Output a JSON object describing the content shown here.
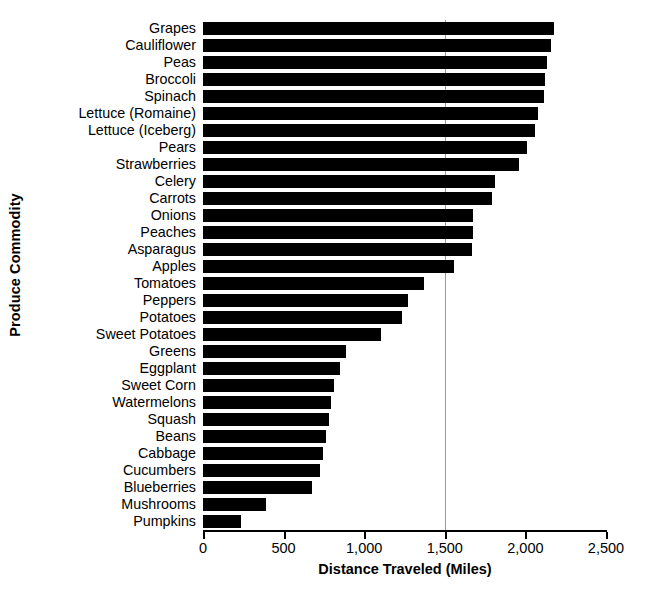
{
  "chart_data": {
    "type": "bar",
    "orientation": "horizontal",
    "title": "",
    "xlabel": "Distance Traveled (Miles)",
    "ylabel": "Produce Commodity",
    "xlim": [
      0,
      2500
    ],
    "xticks": [
      0,
      500,
      1000,
      1500,
      2000,
      2500
    ],
    "xticklabels": [
      "0",
      "500",
      "1,000",
      "1,500",
      "2,000",
      "2,500"
    ],
    "gridlines": [
      1500
    ],
    "grid": "vertical-single",
    "legend": "none",
    "bar_color": "#000000",
    "categories": [
      "Grapes",
      "Cauliflower",
      "Peas",
      "Broccoli",
      "Spinach",
      "Lettuce (Romaine)",
      "Lettuce (Iceberg)",
      "Pears",
      "Strawberries",
      "Celery",
      "Carrots",
      "Onions",
      "Peaches",
      "Asparagus",
      "Apples",
      "Tomatoes",
      "Peppers",
      "Potatoes",
      "Sweet Potatoes",
      "Greens",
      "Eggplant",
      "Sweet Corn",
      "Watermelons",
      "Squash",
      "Beans",
      "Cabbage",
      "Cucumbers",
      "Blueberries",
      "Mushrooms",
      "Pumpkins"
    ],
    "values": [
      2176,
      2156,
      2134,
      2121,
      2114,
      2080,
      2058,
      2008,
      1958,
      1812,
      1795,
      1675,
      1674,
      1671,
      1555,
      1369,
      1271,
      1236,
      1105,
      889,
      852,
      813,
      792,
      781,
      766,
      746,
      727,
      679,
      391,
      236
    ]
  }
}
